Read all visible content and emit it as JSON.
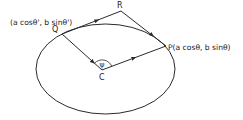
{
  "diagram": {
    "type": "ellipse-geometry",
    "colors": {
      "stroke": "#2a2a2a",
      "text": "#1a1a1a",
      "background": "#ffffff"
    },
    "labels": {
      "Q_coord": "(a cosθ', b sinθ')",
      "Q": "Q",
      "R": "R",
      "P": "P(a cosθ, b sinθ)",
      "C": "C",
      "angle": "ψ"
    },
    "points": {
      "Q": {
        "name": "Q",
        "coords": "(a cosθ', b sinθ')"
      },
      "P": {
        "name": "P",
        "coords": "(a cosθ, b sinθ)"
      },
      "R": {
        "name": "R"
      },
      "C": {
        "name": "C",
        "role": "center"
      }
    },
    "segments": [
      {
        "from": "Q",
        "to": "R",
        "arrow": true
      },
      {
        "from": "R",
        "to": "P",
        "arrow": true
      },
      {
        "from": "Q",
        "to": "C",
        "arrow": true
      },
      {
        "from": "C",
        "to": "P",
        "arrow": true
      }
    ],
    "angle_at_C": "ψ"
  }
}
